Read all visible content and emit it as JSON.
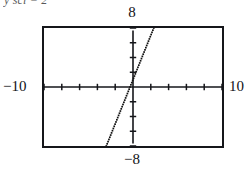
{
  "caption": {
    "text": "y scl = 2"
  },
  "labels": {
    "y_max": "8",
    "y_min": "−8",
    "x_min": "−10",
    "x_max": "10"
  },
  "colors": {
    "ink": "#15161a",
    "frame": "#15161a",
    "background": "#ffffff",
    "plot_line": "#111111"
  },
  "chart_data": {
    "type": "line",
    "title": "",
    "subtitle": "",
    "xlabel": "",
    "ylabel": "",
    "xlim": [
      -10,
      10
    ],
    "ylim": [
      -8,
      8
    ],
    "xscl": 2,
    "yscl": 2,
    "grid": false,
    "legend": null,
    "axes_style": "calculator-window",
    "x_axis_tick_values": [
      -10,
      -8,
      -6,
      -4,
      -2,
      0,
      2,
      4,
      6,
      8,
      10
    ],
    "y_axis_tick_values": [
      -8,
      -6,
      -4,
      -2,
      0,
      2,
      4,
      6,
      8
    ],
    "tick_marks_visible": true,
    "render_style": "dotted-pixel-trace",
    "series": [
      {
        "name": "line",
        "equation": "y = 3x + 1",
        "slope": 3,
        "intercept": 1,
        "x": [
          -3.0,
          -2.6,
          -2.2,
          -1.8,
          -1.4,
          -1.0,
          -0.6,
          -0.2,
          0.2,
          0.6,
          1.0,
          1.4,
          1.8,
          2.2
        ],
        "values": [
          -8.0,
          -6.8,
          -5.6,
          -4.4,
          -3.2,
          -2.0,
          -0.8,
          0.4,
          1.6,
          2.8,
          4.0,
          5.2,
          6.4,
          7.6
        ],
        "x_intercept": -0.333,
        "y_intercept": 1
      }
    ],
    "annotations": [
      {
        "text": "y scl = 2",
        "position": "top-left",
        "clipped": true
      },
      {
        "text": "8",
        "position": "top-center",
        "meaning": "y maximum"
      },
      {
        "text": "−8",
        "position": "bottom-center",
        "meaning": "y minimum"
      },
      {
        "text": "−10",
        "position": "left-middle",
        "meaning": "x minimum"
      },
      {
        "text": "10",
        "position": "right-middle",
        "meaning": "x maximum"
      }
    ]
  }
}
